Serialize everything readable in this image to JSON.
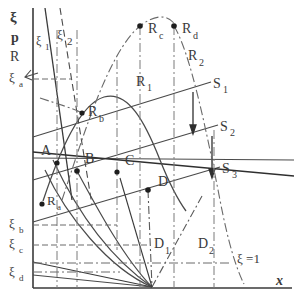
{
  "figure": {
    "axes": {
      "y_axis_label_lines": [
        "ξ",
        "p",
        "R"
      ],
      "x_axis_label": "x"
    },
    "y_tick_labels": [
      {
        "id": "xi_a",
        "text": "ξ",
        "sub": "a",
        "x": 9,
        "y": 82
      },
      {
        "id": "xi_b",
        "text": "ξ",
        "sub": "b",
        "x": 9,
        "y": 228
      },
      {
        "id": "xi_c",
        "text": "ξ",
        "sub": "c",
        "x": 9,
        "y": 248
      },
      {
        "id": "xi_d",
        "text": "ξ",
        "sub": "d",
        "x": 9,
        "y": 276
      }
    ],
    "curve_labels": [
      {
        "id": "xi_1",
        "text": "ξ",
        "sub": "1",
        "x": 36,
        "y": 45
      },
      {
        "id": "xi_2",
        "text": "ξ",
        "sub": "2",
        "x": 57,
        "y": 39
      },
      {
        "id": "R_1",
        "text": "R",
        "sub": "1",
        "x": 136,
        "y": 86
      },
      {
        "id": "R_2",
        "text": "R",
        "sub": "2",
        "x": 188,
        "y": 60
      },
      {
        "id": "S_1",
        "text": "S",
        "sub": "1",
        "x": 213,
        "y": 88
      },
      {
        "id": "S_2",
        "text": "S",
        "sub": "2",
        "x": 220,
        "y": 131
      },
      {
        "id": "S_3",
        "text": "S",
        "sub": "3",
        "x": 222,
        "y": 173
      },
      {
        "id": "D_1",
        "text": "D",
        "sub": "1",
        "x": 154,
        "y": 248
      },
      {
        "id": "D_2",
        "text": "D",
        "sub": "2",
        "x": 198,
        "y": 248
      }
    ],
    "point_labels": [
      {
        "id": "R_a",
        "text": "R",
        "sub": "a",
        "x": 47,
        "y": 205
      },
      {
        "id": "R_b",
        "text": "R",
        "sub": "b",
        "x": 88,
        "y": 116
      },
      {
        "id": "R_c",
        "text": "R",
        "sub": "c",
        "x": 148,
        "y": 33
      },
      {
        "id": "R_d",
        "text": "R",
        "sub": "d",
        "x": 182,
        "y": 33
      },
      {
        "id": "A",
        "text": "A",
        "sub": "",
        "x": 41,
        "y": 155
      },
      {
        "id": "B",
        "text": "B",
        "sub": "",
        "x": 85,
        "y": 163
      },
      {
        "id": "C",
        "text": "C",
        "sub": "",
        "x": 125,
        "y": 165
      },
      {
        "id": "D",
        "text": "D",
        "sub": "",
        "x": 158,
        "y": 186
      }
    ],
    "annotations": [
      {
        "id": "xi-equals-one",
        "text": "ξ =1",
        "x": 237,
        "y": 263
      }
    ],
    "markers": [
      {
        "id": "marker-A",
        "x": 57,
        "y": 163
      },
      {
        "id": "marker-B",
        "x": 77,
        "y": 171
      },
      {
        "id": "marker-C",
        "x": 117,
        "y": 172
      },
      {
        "id": "marker-D",
        "x": 148,
        "y": 190
      },
      {
        "id": "marker-Ra",
        "x": 42,
        "y": 204
      },
      {
        "id": "marker-Rb",
        "x": 82,
        "y": 113
      },
      {
        "id": "marker-Rc",
        "x": 140,
        "y": 26
      },
      {
        "id": "marker-Rd",
        "x": 174,
        "y": 26
      }
    ],
    "colors": {
      "ink": "#3a3a3a",
      "line": "#4a4a4a",
      "faint": "#8c8c8c",
      "background": "#ffffff"
    }
  }
}
